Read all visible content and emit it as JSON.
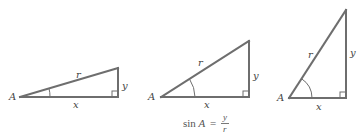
{
  "colors": {
    "line": "#6e6e6e",
    "text": "#444444",
    "background": "#ffffff"
  },
  "triangles": [
    {
      "name": "small-angle",
      "labels": {
        "vertex": "A",
        "hypotenuse": "r",
        "opposite": "y",
        "adjacent": "x"
      },
      "points": {
        "A": [
          20,
          97
        ],
        "C": [
          118,
          97
        ],
        "B": [
          118,
          68
        ]
      }
    },
    {
      "name": "medium-angle",
      "labels": {
        "vertex": "A",
        "hypotenuse": "r",
        "opposite": "y",
        "adjacent": "x"
      },
      "points": {
        "A": [
          161,
          97
        ],
        "C": [
          249,
          97
        ],
        "B": [
          249,
          41
        ]
      }
    },
    {
      "name": "large-angle",
      "labels": {
        "vertex": "A",
        "hypotenuse": "r",
        "opposite": "y",
        "adjacent": "x"
      },
      "points": {
        "A": [
          289,
          98
        ],
        "C": [
          346,
          98
        ],
        "B": [
          346,
          10
        ]
      }
    }
  ],
  "formula": {
    "lhs_fn": "sin",
    "lhs_var": "A",
    "equals": "=",
    "numerator": "y",
    "denominator": "r"
  }
}
